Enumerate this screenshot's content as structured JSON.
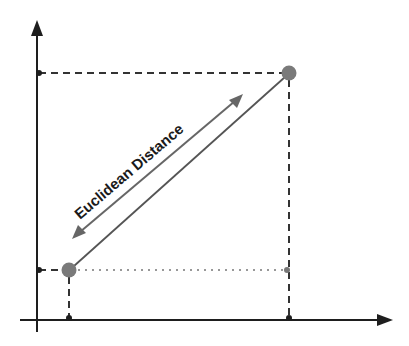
{
  "diagram": {
    "label": "Euclidean Distance",
    "colors": {
      "axis": "#1e1e1e",
      "guide": "#333333",
      "point": "#7a7a7a",
      "distance_line": "#555555",
      "arrow": "#666666"
    },
    "points": [
      {
        "name": "point-a",
        "x": 69,
        "y": 270
      },
      {
        "name": "point-b",
        "x": 289,
        "y": 73
      }
    ]
  }
}
